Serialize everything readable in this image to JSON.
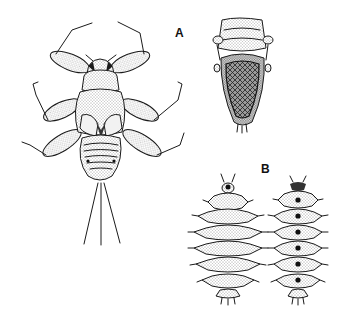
{
  "figure": {
    "background": "#ffffff",
    "ink_color": "#1a1a1a",
    "panels": [
      {
        "label": "A",
        "specimens": [
          {
            "name": "nymph-dorsal-view",
            "description": "Dorsal view of aquatic insect nymph with six legs and three caudal filaments"
          },
          {
            "name": "nymph-ventral-view",
            "description": "Ventral view showing large oval gill plate / operculum covering abdomen"
          }
        ]
      },
      {
        "label": "B",
        "specimens": [
          {
            "name": "larva-dorsal-view",
            "description": "Dorsal view of segmented larva with spiny lateral projections"
          },
          {
            "name": "larva-ventral-view",
            "description": "Ventral view of segmented larva with dark central spots on each segment"
          }
        ]
      }
    ]
  }
}
